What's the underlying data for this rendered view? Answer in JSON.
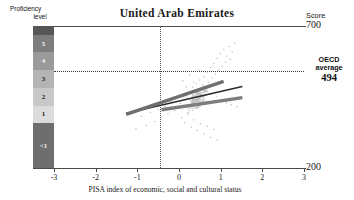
{
  "chart_data": {
    "type": "scatter",
    "title": "United Arab Emirates",
    "xlabel": "PISA index of economic, social and cultural status",
    "ylabel": "Score",
    "xlim": [
      -3,
      3
    ],
    "ylim": [
      200,
      700
    ],
    "grid": false,
    "legend": "none",
    "xticks": [
      -3,
      -2,
      -1,
      0,
      1,
      2,
      3
    ],
    "xtick_labels": [
      "-3",
      "-2",
      "-1",
      "0",
      "1",
      "2",
      "3"
    ],
    "yticks": [
      200,
      700
    ],
    "ytick_labels": [
      "200",
      "700"
    ],
    "annotations": [
      {
        "name": "oecd-average",
        "label_line1": "OECD",
        "label_line2": "average",
        "value": 494,
        "value_label": "494",
        "type": "horizontal-dotted-line"
      },
      {
        "name": "index-zero",
        "value": 0,
        "type": "vertical-dotted-line"
      },
      {
        "name": "score-axis-caption",
        "label": "Score"
      },
      {
        "name": "proficiency-axis-caption",
        "label_line1": "Proficiency",
        "label_line2": "level"
      }
    ],
    "proficiency_bands": [
      {
        "label": "6",
        "score_min": 669,
        "score_max": 700,
        "color": "#565656",
        "text_light": true,
        "show_label": false
      },
      {
        "label": "5",
        "score_min": 607,
        "score_max": 669,
        "color": "#7d7d7d",
        "text_light": true,
        "show_label": true
      },
      {
        "label": "4",
        "score_min": 545,
        "score_max": 607,
        "color": "#9a9a9a",
        "text_light": true,
        "show_label": true
      },
      {
        "label": "3",
        "score_min": 483,
        "score_max": 545,
        "color": "#b4b4b4",
        "text_light": false,
        "show_label": true
      },
      {
        "label": "2",
        "score_min": 420,
        "score_max": 483,
        "color": "#c8c8c8",
        "text_light": false,
        "show_label": true
      },
      {
        "label": "1",
        "score_min": 358,
        "score_max": 420,
        "color": "#dcdcdc",
        "text_light": false,
        "show_label": true
      },
      {
        "label": "<1",
        "score_min": 200,
        "score_max": 358,
        "color": "#6e6e6e",
        "text_light": true,
        "show_label": true
      }
    ],
    "trend_lines": [
      {
        "name": "national-regression-line",
        "style": "thin-dark",
        "color": "#2b2b2b",
        "width": 1.6,
        "x_start": -1.27,
        "y_start": 393,
        "x_end": 1.52,
        "y_end": 487
      },
      {
        "name": "steep-grey-line",
        "style": "thick-grey",
        "color": "#6f6f6f",
        "width": 3.4,
        "x_start": -1.27,
        "y_start": 389,
        "x_end": 1.07,
        "y_end": 505
      },
      {
        "name": "shallow-grey-line",
        "style": "thick-grey",
        "color": "#7c7c7c",
        "width": 3.4,
        "x_start": -0.42,
        "y_start": 405,
        "x_end": 1.52,
        "y_end": 448
      }
    ],
    "scatter": {
      "color": "#b9b9b9",
      "marker": "point",
      "n_points": 230,
      "x_center": 0.42,
      "y_center": 445,
      "points": [
        [
          0.02,
          430
        ],
        [
          0.1,
          452
        ],
        [
          0.18,
          468
        ],
        [
          0.25,
          441
        ],
        [
          0.31,
          487
        ],
        [
          0.36,
          455
        ],
        [
          0.4,
          500
        ],
        [
          0.44,
          471
        ],
        [
          0.48,
          512
        ],
        [
          0.52,
          462
        ],
        [
          0.55,
          494
        ],
        [
          0.58,
          523
        ],
        [
          0.62,
          480
        ],
        [
          0.66,
          540
        ],
        [
          0.7,
          505
        ],
        [
          0.74,
          556
        ],
        [
          0.78,
          519
        ],
        [
          0.82,
          570
        ],
        [
          0.86,
          533
        ],
        [
          0.9,
          588
        ],
        [
          0.94,
          548
        ],
        [
          0.98,
          604
        ],
        [
          1.02,
          561
        ],
        [
          1.06,
          620
        ],
        [
          1.1,
          575
        ],
        [
          1.14,
          596
        ],
        [
          1.18,
          630
        ],
        [
          1.22,
          585
        ],
        [
          1.26,
          612
        ],
        [
          1.32,
          642
        ],
        [
          -0.05,
          418
        ],
        [
          -0.12,
          404
        ],
        [
          -0.2,
          436
        ],
        [
          -0.28,
          392
        ],
        [
          -0.35,
          420
        ],
        [
          -0.44,
          378
        ],
        [
          -0.52,
          408
        ],
        [
          -0.6,
          366
        ],
        [
          -0.7,
          398
        ],
        [
          -0.8,
          352
        ],
        [
          -0.92,
          384
        ],
        [
          -1.05,
          340
        ],
        [
          0.05,
          380
        ],
        [
          0.12,
          362
        ],
        [
          0.2,
          398
        ],
        [
          0.28,
          346
        ],
        [
          0.34,
          372
        ],
        [
          0.42,
          334
        ],
        [
          0.5,
          358
        ],
        [
          0.58,
          322
        ],
        [
          0.66,
          350
        ],
        [
          0.74,
          310
        ],
        [
          0.82,
          338
        ],
        [
          0.9,
          300
        ],
        [
          0.08,
          510
        ],
        [
          0.16,
          488
        ],
        [
          0.24,
          530
        ],
        [
          0.33,
          505
        ],
        [
          0.46,
          548
        ],
        [
          0.6,
          470
        ],
        [
          0.72,
          462
        ],
        [
          0.88,
          455
        ],
        [
          1.0,
          440
        ],
        [
          1.12,
          432
        ],
        [
          1.24,
          425
        ],
        [
          1.38,
          418
        ]
      ]
    }
  }
}
